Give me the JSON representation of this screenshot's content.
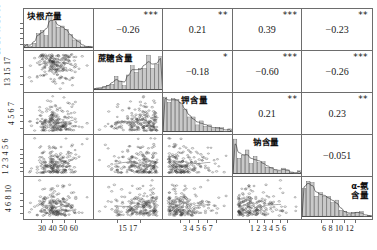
{
  "figure": {
    "type": "scatterplot-matrix",
    "n_variables": 5
  },
  "variables": [
    {
      "key": "root_yield",
      "label": "块根产量",
      "label_lines": [
        "块根产量"
      ]
    },
    {
      "key": "sucrose",
      "label": "蔗糖含量",
      "label_lines": [
        "蔗糖含量"
      ]
    },
    {
      "key": "potassium",
      "label": "钾含量",
      "label_lines": [
        "钾含量"
      ]
    },
    {
      "key": "sodium",
      "label": "钠含量",
      "label_lines": [
        "钠含量"
      ]
    },
    {
      "key": "alpha_amino_n",
      "label": "α-氨含量",
      "label_lines": [
        "α-氨",
        "含量"
      ]
    }
  ],
  "axes": {
    "x_ticks": [
      [
        "30",
        "40",
        "50",
        "60"
      ],
      [
        "15",
        "17"
      ],
      [
        "3",
        "4",
        "5",
        "6",
        "7"
      ],
      [
        "1",
        "2",
        "3",
        "4",
        "5",
        "6"
      ],
      [
        "6",
        "8",
        "10",
        "12"
      ]
    ],
    "y_ticks": [
      [
        "19",
        "30",
        "40",
        "50",
        "60"
      ],
      [
        "13",
        "15",
        "17"
      ],
      [
        "4",
        "5",
        "6",
        "7"
      ],
      [
        "1",
        "2",
        "3",
        "4",
        "5",
        "6"
      ],
      [
        "4",
        "6",
        "8",
        "10"
      ]
    ]
  },
  "chart_data": {
    "type": "scatter",
    "title": "",
    "xlabel": "",
    "ylabel": "",
    "grid": false,
    "legend": "none",
    "variables": [
      "块根产量",
      "蔗糖含量",
      "钾含量",
      "钠含量",
      "α-氨含量"
    ],
    "x_tick_labels": [
      [
        "30",
        "40",
        "50",
        "60"
      ],
      [
        "15",
        "17"
      ],
      [
        "3",
        "4",
        "5",
        "6",
        "7"
      ],
      [
        "1",
        "2",
        "3",
        "4",
        "5",
        "6"
      ],
      [
        "6",
        "8",
        "10",
        "12"
      ]
    ],
    "y_tick_labels": [
      [
        "19",
        "30",
        "40",
        "50",
        "60"
      ],
      [
        "13",
        "15",
        "17"
      ],
      [
        "4",
        "5",
        "6",
        "7"
      ],
      [
        "1",
        "2",
        "3",
        "4",
        "5",
        "6"
      ],
      [
        "4",
        "6",
        "8",
        "10"
      ]
    ],
    "correlations": [
      {
        "row": 0,
        "col": 1,
        "r": "−0.26",
        "stars": "***",
        "value": -0.26,
        "x": "块根产量",
        "y": "蔗糖含量"
      },
      {
        "row": 0,
        "col": 2,
        "r": "0.21",
        "stars": "**",
        "value": 0.21,
        "x": "块根产量",
        "y": "钾含量"
      },
      {
        "row": 0,
        "col": 3,
        "r": "0.39",
        "stars": "***",
        "value": 0.39,
        "x": "块根产量",
        "y": "钠含量"
      },
      {
        "row": 0,
        "col": 4,
        "r": "−0.23",
        "stars": "**",
        "value": -0.23,
        "x": "块根产量",
        "y": "α-氨含量"
      },
      {
        "row": 1,
        "col": 2,
        "r": "−0.18",
        "stars": "*",
        "value": -0.18,
        "x": "蔗糖含量",
        "y": "钾含量"
      },
      {
        "row": 1,
        "col": 3,
        "r": "−0.60",
        "stars": "***",
        "value": -0.6,
        "x": "蔗糖含量",
        "y": "钠含量"
      },
      {
        "row": 1,
        "col": 4,
        "r": "−0.26",
        "stars": "***",
        "value": -0.26,
        "x": "蔗糖含量",
        "y": "α-氨含量"
      },
      {
        "row": 2,
        "col": 3,
        "r": "0.21",
        "stars": "**",
        "value": 0.21,
        "x": "钾含量",
        "y": "钠含量"
      },
      {
        "row": 2,
        "col": 4,
        "r": "0.23",
        "stars": "**",
        "value": 0.23,
        "x": "钾含量",
        "y": "α-氨含量"
      },
      {
        "row": 3,
        "col": 4,
        "r": "−0.051",
        "stars": "",
        "value": -0.051,
        "x": "钠含量",
        "y": "α-氨含量"
      }
    ],
    "diagonal_distributions": [
      {
        "variable": "块根产量",
        "shape": "symmetric-bell",
        "range": [
          19,
          60
        ],
        "peak": 42
      },
      {
        "variable": "蔗糖含量",
        "shape": "left-skewed",
        "range": [
          12,
          18.5
        ],
        "peak": 17
      },
      {
        "variable": "钾含量",
        "shape": "right-skewed",
        "range": [
          3,
          7.5
        ],
        "peak": 4.2
      },
      {
        "variable": "钠含量",
        "shape": "right-skewed",
        "range": [
          0.5,
          6.5
        ],
        "peak": 1.2
      },
      {
        "variable": "α-氨含量",
        "shape": "right-skewed",
        "range": [
          4,
          12.5
        ],
        "peak": 6.2
      }
    ],
    "trend_slopes": [
      {
        "row": 1,
        "col": 0,
        "slope": "negative"
      },
      {
        "row": 2,
        "col": 0,
        "slope": "positive"
      },
      {
        "row": 3,
        "col": 0,
        "slope": "positive"
      },
      {
        "row": 4,
        "col": 0,
        "slope": "negative"
      },
      {
        "row": 2,
        "col": 1,
        "slope": "negative"
      },
      {
        "row": 3,
        "col": 1,
        "slope": "negative"
      },
      {
        "row": 4,
        "col": 1,
        "slope": "negative"
      },
      {
        "row": 3,
        "col": 2,
        "slope": "positive"
      },
      {
        "row": 4,
        "col": 2,
        "slope": "positive"
      },
      {
        "row": 4,
        "col": 3,
        "slope": "flat"
      }
    ]
  },
  "colors": {
    "frame": "#6d6d6d",
    "text": "#1a1a1a",
    "histogram_fill": "#c9c9c9",
    "point": "#3b3b3b",
    "trend": "#777777"
  }
}
